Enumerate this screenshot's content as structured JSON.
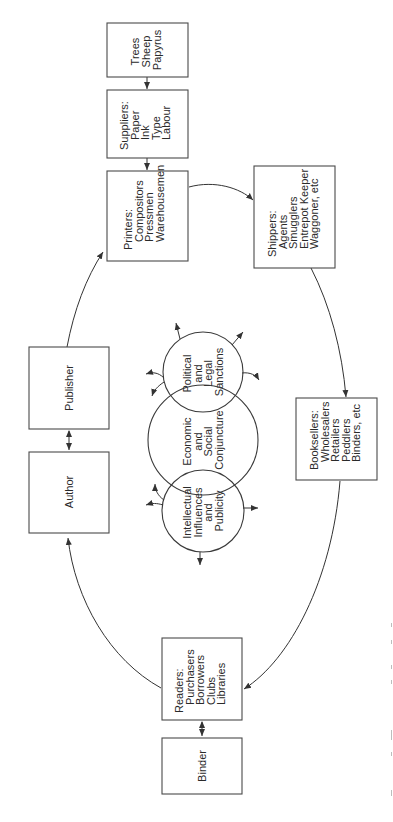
{
  "diagram": {
    "orientation": "rotated-90-ccw",
    "colors": {
      "stroke": "#4a4a4a",
      "text": "#2a2a2a",
      "background": "#ffffff"
    },
    "nodes": {
      "trees": {
        "lines": [
          "Trees",
          "Sheep",
          "Papyrus"
        ]
      },
      "suppliers": {
        "lines": [
          "Suppliers:",
          "Paper",
          "Ink",
          "Type",
          "Labour"
        ]
      },
      "printers": {
        "lines": [
          "Printers:",
          "Compositors",
          "Pressmen",
          "Warehousemen"
        ]
      },
      "shippers": {
        "lines": [
          "Shippers:",
          "Agents",
          "Smugglers",
          "Entrepot Keeper",
          "Waggoner, etc"
        ]
      },
      "booksellers": {
        "lines": [
          "Booksellers:",
          "Wholesalers",
          "Retailers",
          "Peddlers",
          "Binders, etc"
        ]
      },
      "readers": {
        "lines": [
          "Readers:",
          "Purchasers",
          "Borrowers",
          "Clubs",
          "Libraries"
        ]
      },
      "binder": {
        "lines": [
          "Binder"
        ]
      },
      "author": {
        "lines": [
          "Author"
        ]
      },
      "publisher": {
        "lines": [
          "Publisher"
        ]
      }
    },
    "circles": {
      "political": {
        "lines": [
          "Political",
          "and",
          "Legal",
          "Sanctions"
        ]
      },
      "economic": {
        "lines": [
          "Economic",
          "and",
          "Social",
          "Conjuncture"
        ]
      },
      "intellectual": {
        "lines": [
          "Intellectual",
          "Influences",
          "and",
          "Publicity"
        ]
      }
    },
    "edges": [
      {
        "from": "Trees",
        "to": "Suppliers"
      },
      {
        "from": "Suppliers",
        "to": "Printers"
      },
      {
        "from": "Printers",
        "to": "Shippers"
      },
      {
        "from": "Shippers",
        "to": "Booksellers"
      },
      {
        "from": "Booksellers",
        "to": "Readers"
      },
      {
        "from": "Readers",
        "to": "Binder",
        "bidirectional": true
      },
      {
        "from": "Readers",
        "to": "Author"
      },
      {
        "from": "Author",
        "to": "Publisher",
        "bidirectional": true
      },
      {
        "from": "Publisher",
        "to": "Printers"
      }
    ]
  }
}
